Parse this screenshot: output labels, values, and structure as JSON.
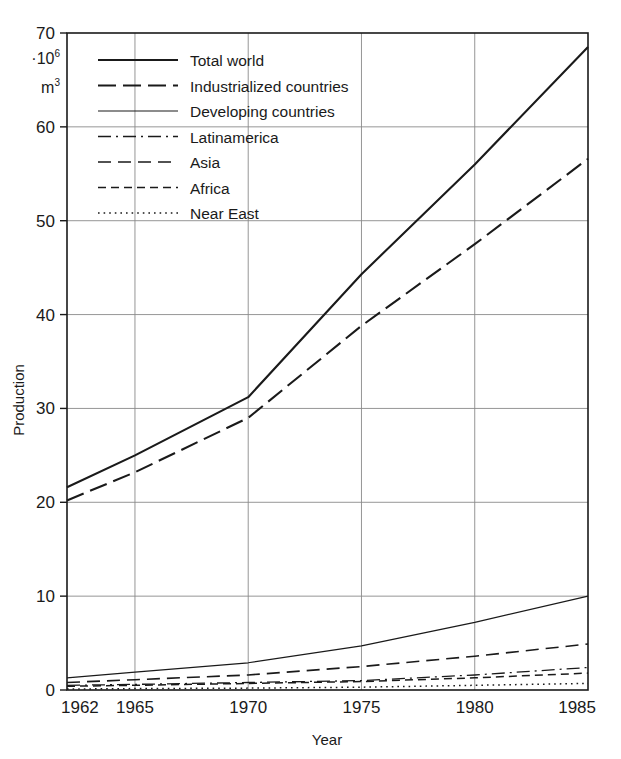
{
  "chart_data": {
    "type": "line",
    "title": "",
    "xlabel": "Year",
    "ylabel": "Production",
    "unit_note": "·10⁶ m³",
    "unit_prefix": "·10",
    "unit_prefix_sup": "6",
    "unit_base": "m",
    "unit_base_sup": "3",
    "xlim": [
      1962,
      1985
    ],
    "ylim": [
      0,
      70
    ],
    "grid": true,
    "legend_position": "upper-left-inside",
    "x": [
      1962,
      1965,
      1970,
      1975,
      1980,
      1985
    ],
    "xticks": [
      "1962",
      "1965",
      "1970",
      "1975",
      "1980",
      "1985"
    ],
    "yticks": [
      "0",
      "10",
      "20",
      "30",
      "40",
      "50",
      "60",
      "70"
    ],
    "ytick_values": [
      0,
      10,
      20,
      30,
      40,
      50,
      60,
      70
    ],
    "series": [
      {
        "name": "Total world",
        "style": "solid",
        "width": 2.1,
        "values": [
          21.6,
          25.0,
          31.2,
          44.3,
          56.0,
          68.5
        ]
      },
      {
        "name": "Industrialized countries",
        "style": "long-dash",
        "width": 2.1,
        "values": [
          20.2,
          23.2,
          29.0,
          38.8,
          47.5,
          56.6
        ]
      },
      {
        "name": "Developing countries",
        "style": "solid-thin",
        "width": 1.2,
        "values": [
          1.3,
          1.9,
          2.9,
          4.7,
          7.2,
          10.0
        ]
      },
      {
        "name": "Latinamerica",
        "style": "dash-dot",
        "width": 1.3,
        "values": [
          0.5,
          0.6,
          0.8,
          1.0,
          1.6,
          2.4
        ]
      },
      {
        "name": "Asia",
        "style": "medium-dash",
        "width": 1.6,
        "values": [
          0.8,
          1.1,
          1.6,
          2.5,
          3.6,
          4.9
        ]
      },
      {
        "name": "Africa",
        "style": "short-dash",
        "width": 1.5,
        "values": [
          0.4,
          0.5,
          0.7,
          0.9,
          1.3,
          1.8
        ]
      },
      {
        "name": "Near East",
        "style": "dotted",
        "width": 1.5,
        "values": [
          0.1,
          0.15,
          0.2,
          0.3,
          0.5,
          0.7
        ]
      }
    ]
  },
  "legend": {
    "items": [
      {
        "label": "Total world"
      },
      {
        "label": "Industrialized countries"
      },
      {
        "label": "Developing countries"
      },
      {
        "label": "Latinamerica"
      },
      {
        "label": "Asia"
      },
      {
        "label": "Africa"
      },
      {
        "label": "Near East"
      }
    ]
  },
  "axes": {
    "x_title": "Year",
    "y_title": "Production"
  }
}
